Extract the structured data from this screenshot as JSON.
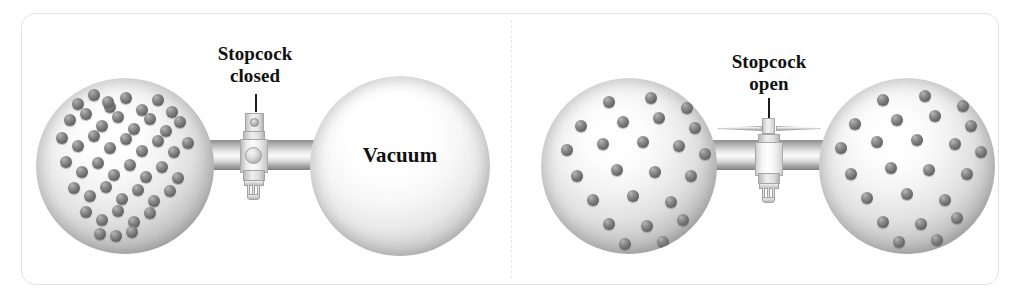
{
  "figure": {
    "frame": {
      "border_color": "#e2e2e2",
      "background": "#ffffff"
    },
    "divider": {
      "style": "dashed",
      "color": "#e6e6e6"
    }
  },
  "colors": {
    "particle": "#6b6b6b",
    "glass_light": "#ffffff",
    "glass_shadow": "#7b7b7b",
    "label_text": "#111111",
    "leader_line": "#1a1a1a"
  },
  "panels": [
    {
      "id": "panel-closed",
      "name": "stopcock-closed-panel",
      "stopcock": {
        "state": "closed",
        "label": "Stopcock\ncloses",
        "label_line1": "Stopcock",
        "label_line2": "closed",
        "handle_orientation": "vertical-end-on"
      },
      "left_bulb": {
        "name": "gas-filled-bulb",
        "content_label": "",
        "particle_count": 48,
        "state": "gas"
      },
      "right_bulb": {
        "name": "vacuum-bulb",
        "content_label": "Vacuum",
        "particle_count": 0,
        "state": "vacuum"
      }
    },
    {
      "id": "panel-open",
      "name": "stopcock-open-panel",
      "stopcock": {
        "state": "open",
        "label": "Stopcock\nopen",
        "label_line1": "Stopcock",
        "label_line2": "open",
        "handle_orientation": "horizontal-side-on"
      },
      "left_bulb": {
        "name": "gas-filled-bulb-left",
        "content_label": "",
        "particle_count": 24,
        "state": "gas"
      },
      "right_bulb": {
        "name": "gas-filled-bulb-right",
        "content_label": "",
        "particle_count": 24,
        "state": "gas"
      }
    }
  ],
  "particles": {
    "panel_closed_left": [
      [
        36,
        20
      ],
      [
        52,
        11
      ],
      [
        68,
        23
      ],
      [
        84,
        14
      ],
      [
        100,
        26
      ],
      [
        116,
        16
      ],
      [
        130,
        28
      ],
      [
        28,
        36
      ],
      [
        44,
        30
      ],
      [
        60,
        42
      ],
      [
        76,
        33
      ],
      [
        92,
        45
      ],
      [
        108,
        35
      ],
      [
        124,
        47
      ],
      [
        138,
        38
      ],
      [
        20,
        54
      ],
      [
        36,
        62
      ],
      [
        52,
        52
      ],
      [
        68,
        64
      ],
      [
        84,
        55
      ],
      [
        100,
        67
      ],
      [
        116,
        57
      ],
      [
        132,
        68
      ],
      [
        146,
        59
      ],
      [
        24,
        78
      ],
      [
        40,
        88
      ],
      [
        56,
        79
      ],
      [
        72,
        91
      ],
      [
        88,
        81
      ],
      [
        104,
        93
      ],
      [
        120,
        83
      ],
      [
        136,
        94
      ],
      [
        32,
        104
      ],
      [
        48,
        112
      ],
      [
        64,
        103
      ],
      [
        80,
        115
      ],
      [
        96,
        106
      ],
      [
        112,
        117
      ],
      [
        128,
        107
      ],
      [
        44,
        128
      ],
      [
        60,
        136
      ],
      [
        76,
        127
      ],
      [
        92,
        138
      ],
      [
        108,
        129
      ],
      [
        58,
        150
      ],
      [
        74,
        152
      ],
      [
        90,
        148
      ],
      [
        66,
        18
      ]
    ],
    "panel_closed_right": [],
    "panel_open_left": [
      [
        62,
        18
      ],
      [
        104,
        14
      ],
      [
        140,
        24
      ],
      [
        34,
        42
      ],
      [
        76,
        38
      ],
      [
        112,
        34
      ],
      [
        148,
        44
      ],
      [
        20,
        66
      ],
      [
        56,
        60
      ],
      [
        96,
        58
      ],
      [
        132,
        62
      ],
      [
        158,
        70
      ],
      [
        30,
        92
      ],
      [
        70,
        86
      ],
      [
        108,
        88
      ],
      [
        144,
        92
      ],
      [
        46,
        116
      ],
      [
        86,
        112
      ],
      [
        124,
        118
      ],
      [
        62,
        140
      ],
      [
        100,
        142
      ],
      [
        136,
        136
      ],
      [
        78,
        160
      ],
      [
        116,
        158
      ]
    ],
    "panel_open_right": [
      [
        58,
        16
      ],
      [
        100,
        12
      ],
      [
        138,
        22
      ],
      [
        30,
        40
      ],
      [
        72,
        36
      ],
      [
        110,
        32
      ],
      [
        146,
        42
      ],
      [
        16,
        64
      ],
      [
        52,
        58
      ],
      [
        92,
        56
      ],
      [
        130,
        60
      ],
      [
        156,
        68
      ],
      [
        26,
        90
      ],
      [
        66,
        84
      ],
      [
        104,
        86
      ],
      [
        142,
        90
      ],
      [
        42,
        114
      ],
      [
        82,
        110
      ],
      [
        120,
        116
      ],
      [
        58,
        138
      ],
      [
        96,
        140
      ],
      [
        132,
        134
      ],
      [
        74,
        158
      ],
      [
        112,
        156
      ]
    ]
  }
}
